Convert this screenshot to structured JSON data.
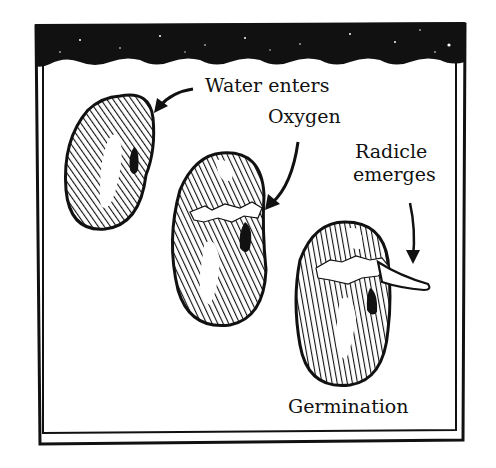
{
  "diagram": {
    "title": "Germination",
    "labels": {
      "water": "Water enters",
      "oxygen": "Oxygen",
      "radicle_line1": "Radicle",
      "radicle_line2": "emerges"
    },
    "stages": [
      {
        "name": "dry-seed",
        "label": "Water enters"
      },
      {
        "name": "seed-coat-splitting",
        "label": "Oxygen"
      },
      {
        "name": "seed-with-radicle",
        "label": "Radicle emerges"
      }
    ],
    "colors": {
      "ink": "#111111",
      "paper": "#ffffff"
    }
  }
}
